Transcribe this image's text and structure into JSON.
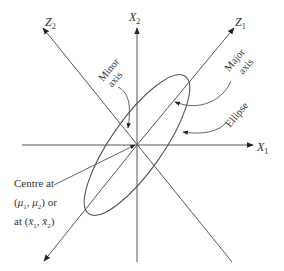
{
  "diagram": {
    "type": "bivariate-normal-ellipse",
    "center": {
      "x": 137,
      "y": 145
    },
    "axes": {
      "x1": {
        "label": "X",
        "sub": "1"
      },
      "x2": {
        "label": "X",
        "sub": "2"
      },
      "z1": {
        "label": "Z",
        "sub": "1"
      },
      "z2": {
        "label": "Z",
        "sub": "2"
      }
    },
    "annotations": {
      "minor_axis": {
        "line1": "Minor",
        "line2": "axis"
      },
      "major_axis": {
        "line1": "Major",
        "line2": "axis"
      },
      "ellipse": "Ellipse",
      "centre": {
        "line1": "Centre at",
        "line2_mu1": "μ",
        "line2_mu1_sub": "1",
        "line2_mu2": "μ",
        "line2_mu2_sub": "2",
        "line2_suffix": "or",
        "line3_prefix": "at",
        "line3_x1": "x̄",
        "line3_x1_sub": "1",
        "line3_x2": "x̄",
        "line3_x2_sub": "2"
      }
    },
    "colors": {
      "line": "#555555",
      "text": "#333333",
      "background": "#ffffff"
    }
  }
}
